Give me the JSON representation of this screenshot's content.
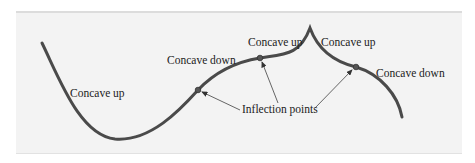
{
  "diagram": {
    "labels": {
      "concave_up_left": "Concave up",
      "concave_down_mid": "Concave down",
      "concave_up_mid": "Concave up",
      "concave_up_right": "Concave up",
      "concave_down_right": "Concave down",
      "inflection_points": "Inflection points"
    },
    "colors": {
      "background": "#f3f3f3",
      "curve": "#4a4a4a",
      "text": "#222222",
      "arrow": "#555555"
    }
  }
}
